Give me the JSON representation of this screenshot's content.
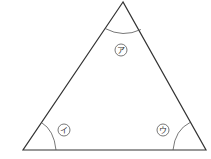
{
  "diagram": {
    "type": "triangle-angles",
    "colors": {
      "line": "#333333",
      "arc": "#555555",
      "background": "#ffffff"
    },
    "vertices": {
      "top": {
        "x": 123,
        "y": 2
      },
      "bottom_left": {
        "x": 23,
        "y": 150
      },
      "bottom_right": {
        "x": 206,
        "y": 150
      }
    },
    "angles": [
      {
        "id": "top",
        "label": "ア",
        "label_x": 121,
        "label_y": 50
      },
      {
        "id": "bottom_left",
        "label": "イ",
        "label_x": 64,
        "label_y": 130
      },
      {
        "id": "bottom_right",
        "label": "ウ",
        "label_x": 163,
        "label_y": 130
      }
    ]
  }
}
